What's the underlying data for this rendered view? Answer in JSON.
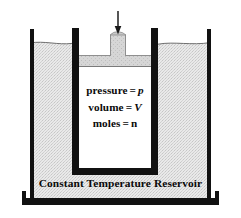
{
  "diagram": {
    "title_hidden": "",
    "reservoir_label": "Constant Temperature Reservoir",
    "gas_properties": [
      {
        "name": "pressure",
        "equals": "=",
        "symbol": "p",
        "italic": true
      },
      {
        "name": "volume",
        "equals": "=",
        "symbol": "V",
        "italic": true
      },
      {
        "name": "moles",
        "equals": "=",
        "symbol": "n",
        "italic": false
      }
    ],
    "parts": {
      "arrow_label": "downward force arrow",
      "piston_label": "piston",
      "piston_knob_label": "piston knob",
      "piston_stem_label": "piston stem",
      "cylinder_label": "cylinder",
      "water_label": "water bath",
      "water_surface_label": "water surface",
      "tank_label": "reservoir tank"
    },
    "colors": {
      "ink": "#0a0a0a",
      "wall": "#111111",
      "water_fill": "#e8e8e8",
      "water_stipple": "#c9c9c9",
      "piston_fill": "#d2d2d2",
      "piston_edge": "#8c8c8c",
      "gas_fill": "#ffffff",
      "background": "#ffffff"
    }
  }
}
